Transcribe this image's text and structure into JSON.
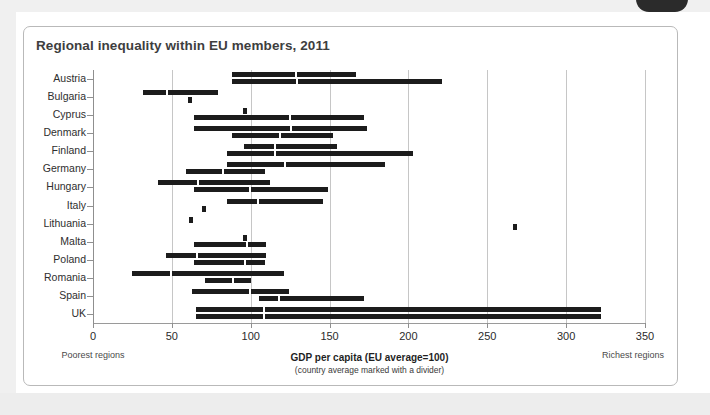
{
  "chart_data": {
    "type": "bar",
    "title": "Regional inequality within EU members, 2011",
    "xlabel": "GDP per capita (EU average=100)",
    "xsublabel": "(country average marked with a divider)",
    "ylabel": "",
    "xlim": [
      0,
      350
    ],
    "xticks": [
      0,
      50,
      100,
      150,
      200,
      250,
      300,
      350
    ],
    "grid": "vertical",
    "legend": "none",
    "orientation": "horizontal",
    "note_left": "Poorest regions",
    "note_right": "Richest regions",
    "categories": [
      "Austria",
      "Bulgaria",
      "Cyprus",
      "Denmark",
      "Finland",
      "Germany",
      "Hungary",
      "Italy",
      "Lithuania",
      "Malta",
      "Poland",
      "Romania",
      "Spain",
      "UK"
    ],
    "series": [
      {
        "name": "regional range (upper row)",
        "ranges": [
          {
            "country": "Austria",
            "min": 88,
            "max": 167,
            "average": 128
          },
          {
            "country": "Bulgaria",
            "min": 32,
            "max": 79,
            "average": 46
          },
          {
            "country": "Cyprus",
            "min": 95,
            "max": 96,
            "average": 95
          },
          {
            "country": "Denmark",
            "min": 64,
            "max": 174,
            "average": 125
          },
          {
            "country": "Finland",
            "min": 96,
            "max": 155,
            "average": 115
          },
          {
            "country": "Germany",
            "min": 85,
            "max": 185,
            "average": 121
          },
          {
            "country": "Hungary",
            "min": 41,
            "max": 112,
            "average": 66
          },
          {
            "country": "Italy",
            "min": 85,
            "max": 146,
            "average": 104
          },
          {
            "country": "Lithuania",
            "min": 61,
            "max": 63,
            "average": 62
          },
          {
            "country": "Malta",
            "min": 95,
            "max": 97,
            "average": 96
          },
          {
            "country": "Poland",
            "min": 46,
            "max": 110,
            "average": 65
          },
          {
            "country": "Romania",
            "min": 25,
            "max": 121,
            "average": 49
          },
          {
            "country": "Spain",
            "min": 63,
            "max": 124,
            "average": 99
          },
          {
            "country": "UK",
            "min": 65,
            "max": 322,
            "average": 108
          }
        ]
      },
      {
        "name": "regional range (lower row)",
        "ranges": [
          {
            "country": "Austria",
            "min": 88,
            "max": 221,
            "average": 129
          },
          {
            "country": "Bulgaria",
            "min": 60,
            "max": 62,
            "average": 61
          },
          {
            "country": "Cyprus",
            "min": 64,
            "max": 172,
            "average": 124
          },
          {
            "country": "Denmark",
            "min": 88,
            "max": 152,
            "average": 118
          },
          {
            "country": "Finland",
            "min": 85,
            "max": 203,
            "average": 115
          },
          {
            "country": "Germany",
            "min": 59,
            "max": 109,
            "average": 82
          },
          {
            "country": "Hungary",
            "min": 64,
            "max": 149,
            "average": 99
          },
          {
            "country": "Italy",
            "min": 69,
            "max": 71,
            "average": 70
          },
          {
            "country": "Lithuania",
            "min": 266,
            "max": 268,
            "average": 267
          },
          {
            "country": "Malta",
            "min": 64,
            "max": 110,
            "average": 97
          },
          {
            "country": "Poland",
            "min": 64,
            "max": 109,
            "average": 96
          },
          {
            "country": "Romania",
            "min": 71,
            "max": 100,
            "average": 88
          },
          {
            "country": "Spain",
            "min": 105,
            "max": 172,
            "average": 117
          },
          {
            "country": "UK",
            "min": 65,
            "max": 322,
            "average": 108
          }
        ]
      }
    ],
    "accent_color": "#1c1c1c",
    "grid_color": "#c6c6c6"
  }
}
